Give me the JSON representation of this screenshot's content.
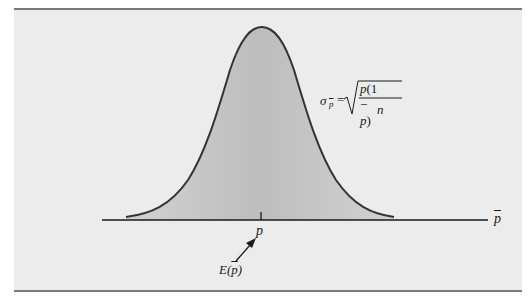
{
  "figure": {
    "type": "normal-distribution-diagram",
    "curve": {
      "shape": "bell",
      "fill_color": "#c8c8c8",
      "stroke_color": "#333333",
      "mean_x": 262,
      "peak_y": 27,
      "left_tail_x": 126,
      "right_tail_x": 394,
      "baseline_y": 217
    },
    "axis": {
      "label": "p̄",
      "x_start": 102,
      "x_end": 488,
      "y": 220,
      "color": "#1a1a1a"
    },
    "mean_tick": {
      "label": "p",
      "x": 261
    },
    "expected_value_annotation": {
      "label": "E(p̄)",
      "label_prefix": "E(",
      "label_var": "p",
      "label_suffix": ")",
      "arrow_from": [
        236,
        261
      ],
      "arrow_to": [
        255,
        240
      ]
    },
    "formula": {
      "lhs_symbol": "σ",
      "lhs_subscript": "p̄",
      "equals": "=",
      "numerator": "p(1 − p)",
      "numerator_p1": "p",
      "numerator_paren": "(1 − ",
      "numerator_p2": "p",
      "numerator_close": ")",
      "denominator": "n",
      "text": "σ_p̄ = √( p(1 − p) / n )"
    },
    "panel": {
      "background": "#ececec",
      "border_color": "#7a7a7a"
    }
  }
}
